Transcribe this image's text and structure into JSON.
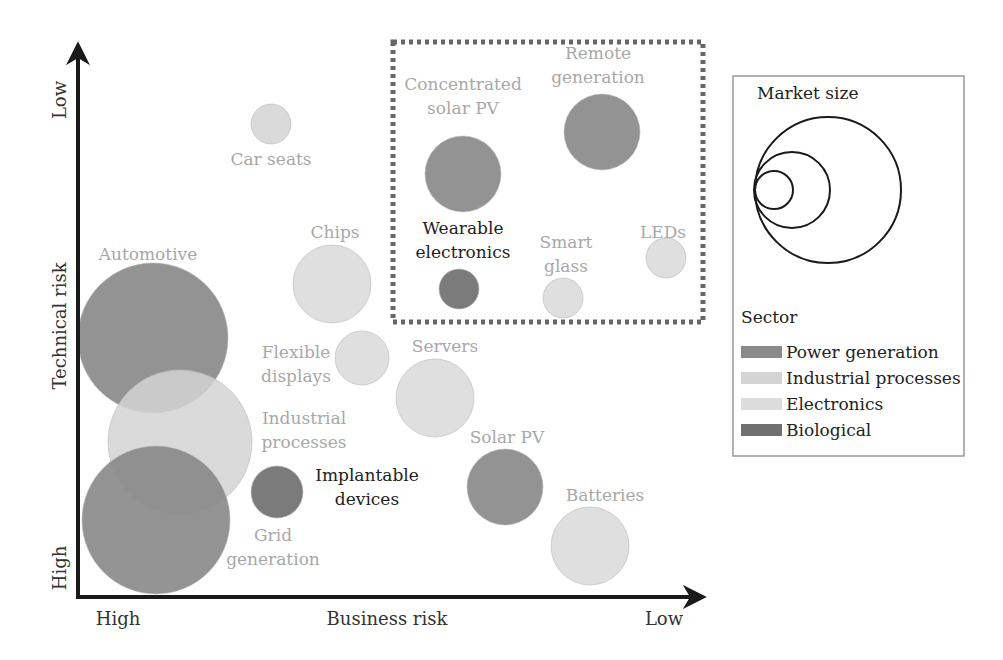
{
  "chart_data": {
    "type": "bubble",
    "title": "",
    "xlabel": "Business risk",
    "ylabel": "Technical risk",
    "x_ticks": {
      "left": "High",
      "right": "Low"
    },
    "y_ticks": {
      "bottom": "High",
      "top": "Low"
    },
    "grid": false,
    "highlight_box": {
      "x": 393,
      "y": 42,
      "w": 310,
      "h": 280,
      "style": "dotted"
    },
    "sectors": [
      {
        "name": "Power generation",
        "color": "#8a8a8a"
      },
      {
        "name": "Industrial processes",
        "color": "#d4d4d4"
      },
      {
        "name": "Electronics",
        "color": "#dcdcdc"
      },
      {
        "name": "Biological",
        "color": "#707070"
      }
    ],
    "points": [
      {
        "label": "Car seats",
        "sector": "Industrial processes",
        "cx": 271,
        "cy": 124,
        "r": 20,
        "label_lines": [
          "Car seats"
        ],
        "lx": 271,
        "ly": 165,
        "text_color": "#a8a8a8"
      },
      {
        "label": "Chips",
        "sector": "Electronics",
        "cx": 332,
        "cy": 284,
        "r": 39,
        "label_lines": [
          "Chips"
        ],
        "lx": 335,
        "ly": 238,
        "text_color": "#a8a8a8"
      },
      {
        "label": "Flexible displays",
        "sector": "Electronics",
        "cx": 362,
        "cy": 358,
        "r": 27,
        "label_lines": [
          "Flexible",
          "displays"
        ],
        "lx": 296,
        "ly": 358,
        "text_color": "#a8a8a8"
      },
      {
        "label": "Servers",
        "sector": "Electronics",
        "cx": 435,
        "cy": 398,
        "r": 39,
        "label_lines": [
          "Servers"
        ],
        "lx": 445,
        "ly": 352,
        "text_color": "#a8a8a8"
      },
      {
        "label": "Automotive",
        "sector": "Power generation",
        "cx": 153,
        "cy": 338,
        "r": 75,
        "label_lines": [
          "Automotive"
        ],
        "lx": 148,
        "ly": 260,
        "text_color": "#a8a8a8"
      },
      {
        "label": "Industrial processes",
        "sector": "Industrial processes",
        "cx": 180,
        "cy": 442,
        "r": 72,
        "label_lines": [
          "Industrial",
          "processes"
        ],
        "lx": 304,
        "ly": 424,
        "text_color": "#a8a8a8"
      },
      {
        "label": "Grid generation",
        "sector": "Power generation",
        "cx": 156,
        "cy": 520,
        "r": 74,
        "label_lines": [
          "Grid",
          "generation"
        ],
        "lx": 273,
        "ly": 541,
        "text_color": "#a8a8a8"
      },
      {
        "label": "Implantable devices",
        "sector": "Biological",
        "cx": 277,
        "cy": 492,
        "r": 26,
        "label_lines": [
          "Implantable",
          "devices"
        ],
        "lx": 367,
        "ly": 481,
        "text_color": "#222222"
      },
      {
        "label": "Solar PV",
        "sector": "Power generation",
        "cx": 505,
        "cy": 487,
        "r": 38,
        "label_lines": [
          "Solar PV"
        ],
        "lx": 507,
        "ly": 443,
        "text_color": "#a8a8a8"
      },
      {
        "label": "Batteries",
        "sector": "Electronics",
        "cx": 590,
        "cy": 546,
        "r": 39,
        "label_lines": [
          "Batteries"
        ],
        "lx": 605,
        "ly": 501,
        "text_color": "#a8a8a8"
      },
      {
        "label": "Concentrated solar PV",
        "sector": "Power generation",
        "cx": 463,
        "cy": 174,
        "r": 38,
        "label_lines": [
          "Concentrated",
          "solar PV"
        ],
        "lx": 463,
        "ly": 90,
        "text_color": "#a8a8a8"
      },
      {
        "label": "Remote generation",
        "sector": "Power generation",
        "cx": 602,
        "cy": 132,
        "r": 38,
        "label_lines": [
          "Remote",
          "generation"
        ],
        "lx": 598,
        "ly": 59,
        "text_color": "#a8a8a8"
      },
      {
        "label": "Wearable electronics",
        "sector": "Biological",
        "cx": 459,
        "cy": 289,
        "r": 20,
        "label_lines": [
          "Wearable",
          "electronics"
        ],
        "lx": 463,
        "ly": 234,
        "text_color": "#222222"
      },
      {
        "label": "Smart glass",
        "sector": "Electronics",
        "cx": 563,
        "cy": 298,
        "r": 20,
        "label_lines": [
          "Smart",
          "glass"
        ],
        "lx": 566,
        "ly": 248,
        "text_color": "#a8a8a8"
      },
      {
        "label": "LEDs",
        "sector": "Electronics",
        "cx": 666,
        "cy": 258,
        "r": 20,
        "label_lines": [
          "LEDs"
        ],
        "lx": 663,
        "ly": 238,
        "text_color": "#a8a8a8"
      }
    ],
    "legend": {
      "position": "right",
      "market_size_title": "Market size",
      "market_size_circles": [
        {
          "cx": 828,
          "cy": 190,
          "r": 73
        },
        {
          "cx": 792,
          "cy": 190,
          "r": 38
        },
        {
          "cx": 774,
          "cy": 190,
          "r": 19
        }
      ],
      "sector_title": "Sector",
      "items": [
        {
          "label": "Power generation",
          "color": "#8a8a8a"
        },
        {
          "label": "Industrial processes",
          "color": "#d4d4d4"
        },
        {
          "label": "Electronics",
          "color": "#dcdcdc"
        },
        {
          "label": "Biological",
          "color": "#707070"
        }
      ]
    }
  }
}
